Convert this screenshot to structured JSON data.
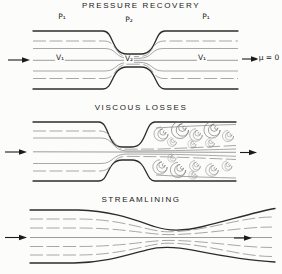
{
  "figure": {
    "colors": {
      "background": "#fcfcfb",
      "ink": "#2c2c2c",
      "streamline": "#929292"
    },
    "panels": [
      {
        "id": "pressure-recovery",
        "title": "PRESSURE RECOVERY",
        "labels": {
          "p_upstream": "P₁",
          "p_throat": "P₂",
          "p_downstream": "P₁",
          "v_upstream": "V₁",
          "v_throat": "V₂",
          "v_downstream": "V₁",
          "viscosity": "μ = 0"
        }
      },
      {
        "id": "viscous-losses",
        "title": "VISCOUS LOSSES"
      },
      {
        "id": "streamlining",
        "title": "STREAMLINING"
      }
    ]
  }
}
